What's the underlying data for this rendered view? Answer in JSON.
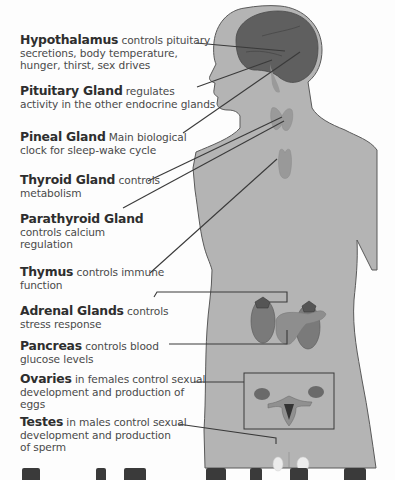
{
  "diagram": {
    "colors": {
      "body_fill": "#b4b4b4",
      "body_outline": "#5a5a5a",
      "brain_fill": "#5f5f5f",
      "organ_fill": "#8a8a8a",
      "leader_line": "#3a3a3a",
      "background": "#fdfdfd"
    },
    "labels": [
      {
        "id": "hypothalamus",
        "name": "Hypothalamus",
        "desc_inline": " controls pituitary",
        "desc_lines": [
          "secretions, body temperature,",
          "hunger, thirst, sex drives"
        ]
      },
      {
        "id": "pituitary",
        "name": "Pituitary Gland",
        "desc_inline": " regulates",
        "desc_lines": [
          "activity in the other endocrine glands"
        ]
      },
      {
        "id": "pineal",
        "name": "Pineal Gland",
        "desc_inline": "  Main biological",
        "desc_lines": [
          "clock for sleep-wake cycle"
        ]
      },
      {
        "id": "thyroid",
        "name": "Thyroid Gland",
        "desc_inline": " controls",
        "desc_lines": [
          "metabolism"
        ]
      },
      {
        "id": "parathyroid",
        "name": "Parathyroid Gland",
        "desc_inline": "",
        "desc_lines": [
          "controls calcium",
          "regulation"
        ]
      },
      {
        "id": "thymus",
        "name": "Thymus",
        "desc_inline": " controls immune",
        "desc_lines": [
          "function"
        ]
      },
      {
        "id": "adrenal",
        "name": "Adrenal Glands",
        "desc_inline": " controls",
        "desc_lines": [
          "stress response"
        ]
      },
      {
        "id": "pancreas",
        "name": "Pancreas",
        "desc_inline": " controls blood",
        "desc_lines": [
          "glucose levels"
        ]
      },
      {
        "id": "ovaries",
        "name": "Ovaries",
        "desc_inline": " in females control sexual",
        "desc_lines": [
          "development and production of",
          "eggs"
        ]
      },
      {
        "id": "testes",
        "name": "Testes",
        "desc_inline": " in males control sexual",
        "desc_lines": [
          "development and production",
          "of sperm"
        ]
      }
    ]
  }
}
